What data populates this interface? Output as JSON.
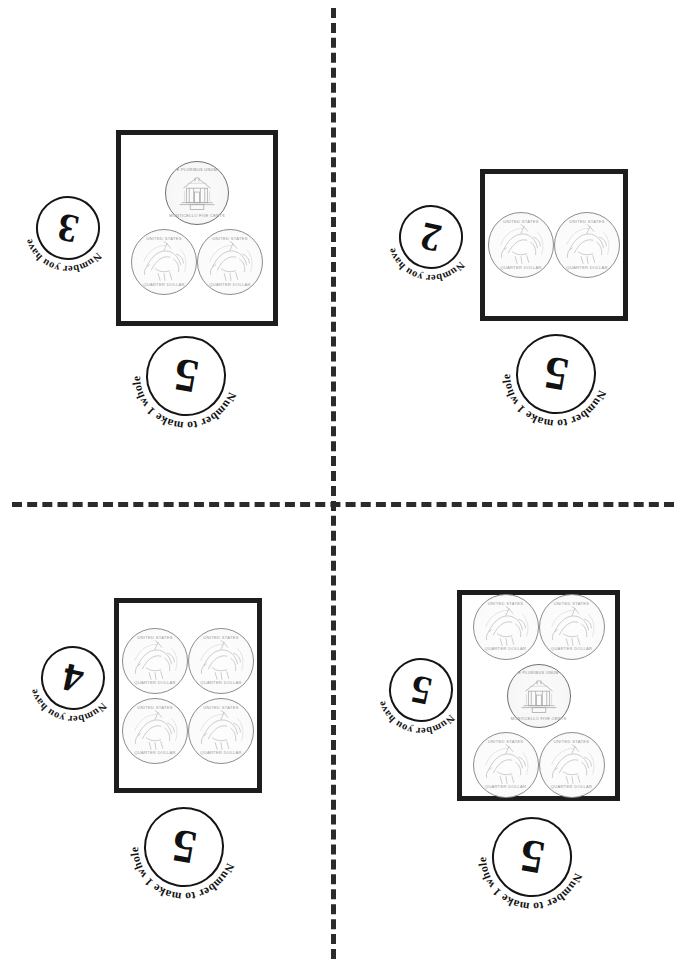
{
  "worksheet": {
    "title": "Coin Fraction Cards",
    "labels": {
      "have": "Number you have",
      "whole": "Number to make 1 whole"
    },
    "coin_faces": {
      "quarter": {
        "top_legend": "UNITED STATES",
        "bottom_legend": "QUARTER DOLLAR"
      },
      "nickel": {
        "top_legend": "E PLURIBUS UNUM",
        "bottom_legend": "MONTICELLO FIVE CENTS"
      }
    },
    "cut_guides": {
      "vertical": "dashed-cut-line-vertical",
      "horizontal": "dashed-cut-line-horizontal"
    }
  },
  "cards": [
    {
      "id": "card-top-left",
      "have": "3",
      "whole": "5",
      "coin_count": 3,
      "rows": [
        {
          "coins": [
            "nickel"
          ]
        },
        {
          "coins": [
            "quarter",
            "quarter"
          ]
        }
      ]
    },
    {
      "id": "card-top-right",
      "have": "2",
      "whole": "5",
      "coin_count": 2,
      "rows": [
        {
          "coins": [
            "quarter",
            "quarter"
          ]
        }
      ]
    },
    {
      "id": "card-bottom-left",
      "have": "4",
      "whole": "5",
      "coin_count": 4,
      "rows": [
        {
          "coins": [
            "quarter",
            "quarter"
          ]
        },
        {
          "coins": [
            "quarter",
            "quarter"
          ]
        }
      ]
    },
    {
      "id": "card-bottom-right",
      "have": "5",
      "whole": "5",
      "coin_count": 5,
      "rows": [
        {
          "coins": [
            "quarter",
            "quarter"
          ]
        },
        {
          "coins": [
            "nickel"
          ]
        },
        {
          "coins": [
            "quarter",
            "quarter"
          ]
        }
      ]
    }
  ],
  "geometry": {
    "cards": [
      {
        "box": {
          "x": 116,
          "y": 130,
          "w": 162,
          "h": 196
        },
        "have_stamp": {
          "x": 36,
          "y": 196,
          "rot": -168
        },
        "whole_stamp": {
          "x": 146,
          "y": 336,
          "rot": -170
        }
      },
      {
        "box": {
          "x": 480,
          "y": 169,
          "w": 148,
          "h": 152
        },
        "have_stamp": {
          "x": 399,
          "y": 205,
          "rot": -168
        },
        "whole_stamp": {
          "x": 516,
          "y": 334,
          "rot": -170
        }
      },
      {
        "box": {
          "x": 114,
          "y": 598,
          "w": 148,
          "h": 195
        },
        "have_stamp": {
          "x": 41,
          "y": 646,
          "rot": -168
        },
        "whole_stamp": {
          "x": 144,
          "y": 807,
          "rot": -170
        }
      },
      {
        "box": {
          "x": 457,
          "y": 590,
          "w": 163,
          "h": 211
        },
        "have_stamp": {
          "x": 389,
          "y": 658,
          "rot": -168
        },
        "whole_stamp": {
          "x": 492,
          "y": 817,
          "rot": -170
        }
      }
    ]
  }
}
